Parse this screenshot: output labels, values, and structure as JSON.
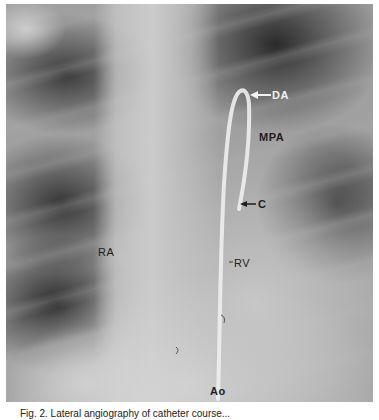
{
  "figure": {
    "labels": {
      "da": "DA",
      "mpa": "MPA",
      "c": "C",
      "ra": "RA",
      "rv": "RV",
      "ao": "Ao"
    },
    "caption": "Fig. 2. Lateral angiography of catheter course..."
  }
}
